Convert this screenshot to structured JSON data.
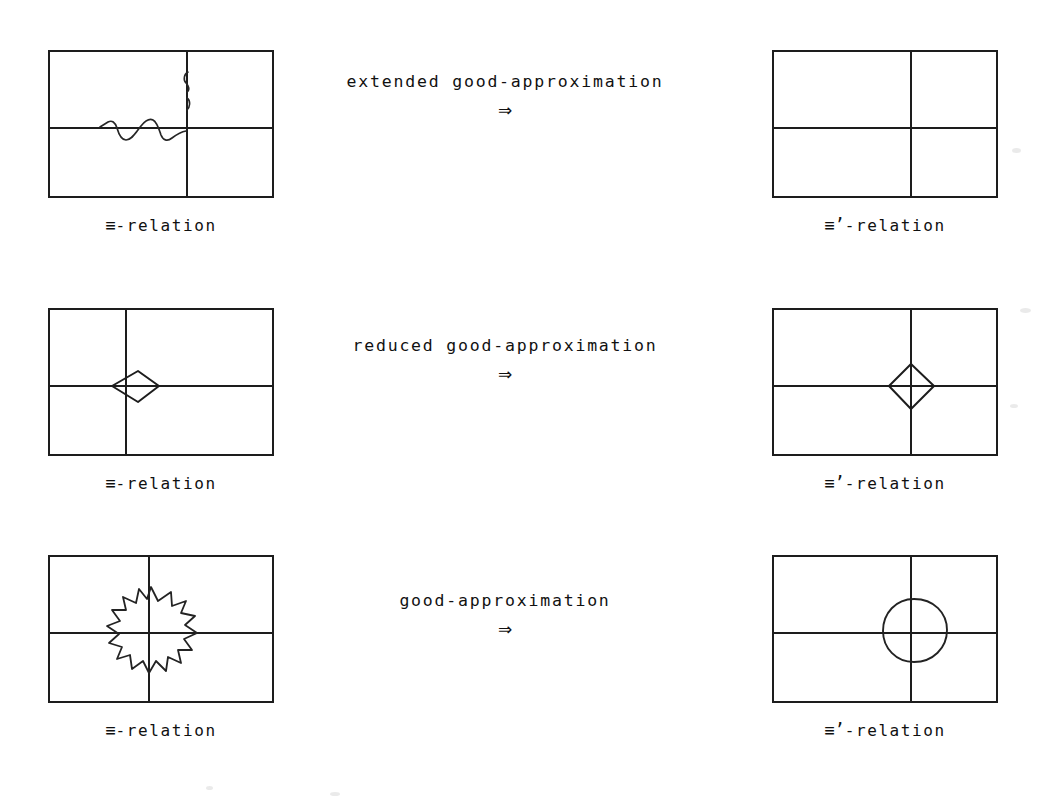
{
  "figure": {
    "background_color": "#ffffff",
    "ink_color": "#1a1a1a",
    "rows": [
      {
        "id": "row-extended",
        "transform_label": "extended good-approximation",
        "transform_arrow": "⇒",
        "left": {
          "caption_symbol": "≡",
          "caption_text": "-relation",
          "shape": "wavy-curve"
        },
        "right": {
          "caption_symbol": "≡’",
          "caption_text": "-relation",
          "shape": "empty"
        }
      },
      {
        "id": "row-reduced",
        "transform_label": "reduced good-approximation",
        "transform_arrow": "⇒",
        "left": {
          "caption_symbol": "≡",
          "caption_text": "-relation",
          "shape": "partial-diamond"
        },
        "right": {
          "caption_symbol": "≡’",
          "caption_text": "-relation",
          "shape": "diamond"
        }
      },
      {
        "id": "row-good",
        "transform_label": "good-approximation",
        "transform_arrow": "⇒",
        "left": {
          "caption_symbol": "≡",
          "caption_text": "-relation",
          "shape": "star-polygon"
        },
        "right": {
          "caption_symbol": "≡’",
          "caption_text": "-relation",
          "shape": "circle"
        }
      }
    ]
  }
}
